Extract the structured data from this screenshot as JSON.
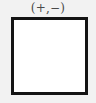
{
  "figure": {
    "label": "(+,−)",
    "background_color": "#f2f2f2",
    "box": {
      "fill_color": "#ffffff",
      "border_color": "#141414",
      "border_width_px": 3,
      "x_px": 11,
      "y_px": 17,
      "width_px": 77,
      "height_px": 78,
      "contents": ""
    },
    "label_color": "#4a4a4a",
    "label_font_size_px": 12,
    "signs": {
      "first": "+",
      "second": "−"
    }
  }
}
